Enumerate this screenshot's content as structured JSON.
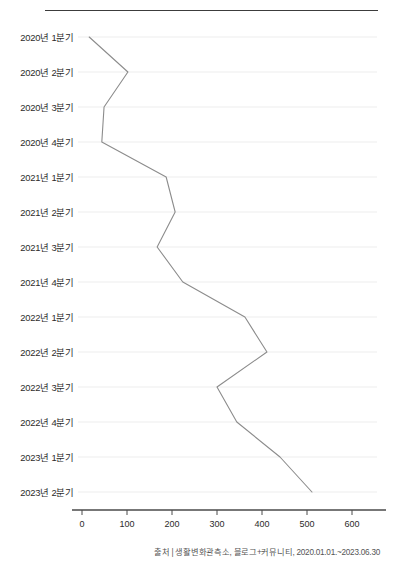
{
  "chart_data": {
    "type": "line",
    "orientation": "horizontal",
    "title": "",
    "xlabel": "",
    "ylabel": "",
    "categories": [
      "2020년 1분기",
      "2020년 2분기",
      "2020년 3분기",
      "2020년 4분기",
      "2021년 1분기",
      "2021년 2분기",
      "2021년 3분기",
      "2021년 4분기",
      "2022년 1분기",
      "2022년 2분기",
      "2022년 3분기",
      "2022년 4분기",
      "2023년 1분기",
      "2023년 2분기"
    ],
    "values": [
      16,
      102,
      49,
      44,
      187,
      207,
      167,
      224,
      362,
      411,
      300,
      344,
      440,
      511
    ],
    "xticks": [
      0,
      100,
      200,
      300,
      400,
      500,
      600
    ],
    "xlim": [
      0,
      650
    ],
    "grid": true,
    "grid_axis": "y",
    "legend": "none",
    "line_color": "#8c8c8c",
    "grid_color": "#ededed",
    "axis_color": "#4a4a4a"
  },
  "footer": {
    "source": "출처 | 생활변화관측소, 블로그+커뮤니티, 2020.01.01.~2023.06.30"
  }
}
